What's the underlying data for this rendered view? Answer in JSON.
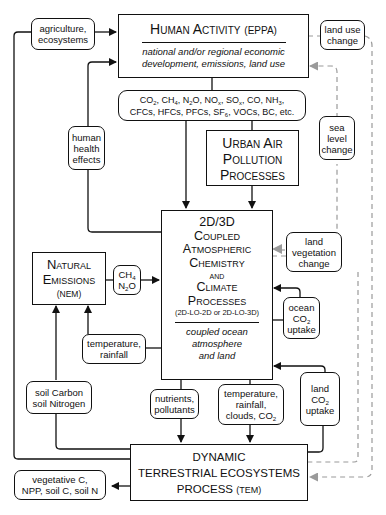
{
  "diagram": {
    "type": "flowchart",
    "nodes": {
      "human_activity": {
        "title": "Human Activity",
        "abbrev": "(EPPA)",
        "description_line1": "national and/or regional economic",
        "description_line2": "development, emissions, land use"
      },
      "emissions_list": {
        "line1_parts": [
          "CO",
          "2",
          ", CH",
          "4",
          ", N",
          "2",
          "O, NO",
          "x",
          ", SO",
          "x",
          ", CO, NH",
          "3",
          ","
        ],
        "line2_parts": [
          "CFCs, HFCs, PFCs, SF",
          "6",
          ", VOCs, BC, etc."
        ]
      },
      "urban_air": {
        "line1": "Urban Air",
        "line2": "Pollution",
        "line3": "Processes"
      },
      "coupled": {
        "line1": "2D/3D",
        "line2": "Coupled",
        "line3": "Atmospheric",
        "line4": "Chemistry",
        "line5": "and",
        "line6": "Climate",
        "line7": "Processes",
        "variants": "(2D-LO-2D or 2D-LO-3D)",
        "sub_line1": "coupled ocean",
        "sub_line2": "atmosphere",
        "sub_line3": "and land"
      },
      "natural_emissions": {
        "line1": "Natural",
        "line2": "Emissions",
        "abbrev": "(NEM)"
      },
      "tem": {
        "line1": "DYNAMIC",
        "line2": "TERRESTRIAL ECOSYSTEMS",
        "line3": "PROCESS",
        "abbrev": "(TEM)"
      }
    },
    "edge_labels": {
      "agriculture": [
        "agriculture,",
        "ecosystems"
      ],
      "human_health": [
        "human",
        "health",
        "effects"
      ],
      "land_use_change": [
        "land use",
        "change"
      ],
      "sea_level_change": [
        "sea",
        "level",
        "change"
      ],
      "land_vegetation_change": [
        "land",
        "vegetation",
        "change"
      ],
      "ch4_n2o": {
        "line1": "CH",
        "line1_sub": "4",
        "line2a": "N",
        "line2_sub": "2",
        "line2b": "O"
      },
      "ocean_co2": {
        "line1": "ocean",
        "line2": "CO",
        "line2_sub": "2",
        "line3": "uptake"
      },
      "land_co2": {
        "line1": "land",
        "line2": "CO",
        "line2_sub": "2",
        "line3": "uptake"
      },
      "temp_rainfall": [
        "temperature,",
        "rainfall"
      ],
      "soil": [
        "soil Carbon",
        "soil Nitrogen"
      ],
      "nutrients": [
        "nutrients,",
        "pollutants"
      ],
      "temp_rain_clouds": {
        "line1": "temperature,",
        "line2": "rainfall,",
        "line3": "clouds, CO",
        "line3_sub": "2"
      },
      "tem_outputs": [
        "vegetative C,",
        "NPP, soil C, soil N"
      ]
    },
    "colors": {
      "solid_edge": "#111111",
      "dashed_edge": "#9a9a9a"
    }
  }
}
